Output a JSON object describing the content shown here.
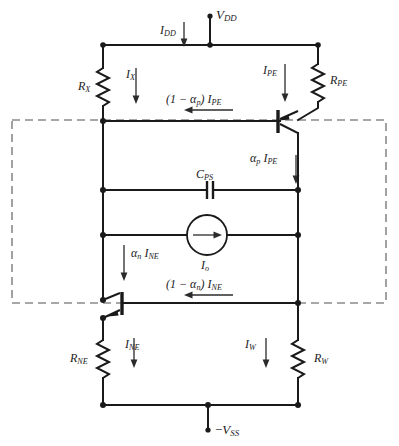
{
  "figure": {
    "type": "circuit-schematic",
    "background_color": "#ffffff",
    "wire_color": "#1a1a1a",
    "dashed_box_color": "#8a8a8a"
  },
  "labels": {
    "vdd": {
      "main": "V",
      "sub": "DD"
    },
    "idd": {
      "main": "I",
      "sub": "DD"
    },
    "rx": {
      "main": "R",
      "sub": "X"
    },
    "ix": {
      "main": "I",
      "sub": "X"
    },
    "ipe": {
      "main": "I",
      "sub": "PE"
    },
    "rpe": {
      "main": "R",
      "sub": "PE"
    },
    "one_minus_alpha_p_ipe": {
      "prefix": "(1 − α",
      "prefix_sub": "p",
      "mid": ") ",
      "main": "I",
      "sub": "PE"
    },
    "alpha_p_ipe": {
      "prefix": "α",
      "prefix_sub": "p",
      "main": "I",
      "sub": "PE"
    },
    "cps": {
      "main": "C",
      "sub": "PS"
    },
    "io": {
      "main": "I",
      "sub": "o"
    },
    "alpha_n_ine": {
      "prefix": "α",
      "prefix_sub": "n",
      "main": "I",
      "sub": "NE"
    },
    "one_minus_alpha_n_ine": {
      "prefix": "(1 − α",
      "prefix_sub": "n",
      "mid": ") ",
      "main": "I",
      "sub": "NE"
    },
    "rne": {
      "main": "R",
      "sub": "NE"
    },
    "ine": {
      "main": "I",
      "sub": "NE"
    },
    "iw": {
      "main": "I",
      "sub": "W"
    },
    "rw": {
      "main": "R",
      "sub": "W"
    },
    "vss": {
      "prefix": "−",
      "main": "V",
      "sub": "SS"
    }
  },
  "components": [
    {
      "name": "resistor-rx",
      "label": "R_X",
      "kind": "resistor"
    },
    {
      "name": "resistor-rpe",
      "label": "R_PE",
      "kind": "resistor"
    },
    {
      "name": "resistor-rne",
      "label": "R_NE",
      "kind": "resistor"
    },
    {
      "name": "resistor-rw",
      "label": "R_W",
      "kind": "resistor"
    },
    {
      "name": "capacitor-cps",
      "label": "C_PS",
      "kind": "capacitor"
    },
    {
      "name": "current-source-io",
      "label": "I_o",
      "kind": "current-source"
    },
    {
      "name": "transistor-pnp",
      "label": "PNP",
      "kind": "bjt-pnp"
    },
    {
      "name": "transistor-npn",
      "label": "NPN",
      "kind": "bjt-npn"
    },
    {
      "name": "terminal-vdd",
      "label": "V_DD",
      "kind": "terminal"
    },
    {
      "name": "terminal-vss",
      "label": "-V_SS",
      "kind": "terminal"
    }
  ],
  "currents": [
    {
      "name": "idd",
      "label": "I_DD",
      "direction": "down"
    },
    {
      "name": "ix",
      "label": "I_X",
      "direction": "down"
    },
    {
      "name": "ipe",
      "label": "I_PE",
      "direction": "down"
    },
    {
      "name": "one-minus-alpha-p-ipe",
      "label": "(1 - alpha_p) I_PE",
      "direction": "left"
    },
    {
      "name": "alpha-p-ipe",
      "label": "alpha_p I_PE",
      "direction": "down"
    },
    {
      "name": "alpha-n-ine",
      "label": "alpha_n I_NE",
      "direction": "down"
    },
    {
      "name": "one-minus-alpha-n-ine",
      "label": "(1 - alpha_n) I_NE",
      "direction": "left"
    },
    {
      "name": "ine",
      "label": "I_NE",
      "direction": "down"
    },
    {
      "name": "iw",
      "label": "I_W",
      "direction": "down"
    },
    {
      "name": "io",
      "label": "I_o",
      "direction": "right"
    }
  ]
}
